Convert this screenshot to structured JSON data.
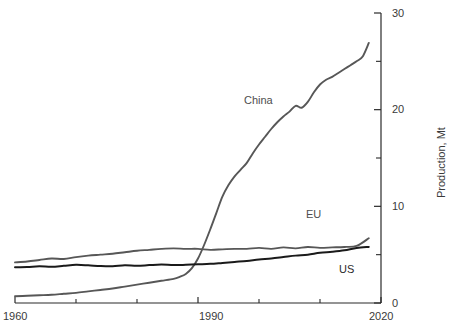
{
  "chart_data": {
    "type": "line",
    "title": "",
    "subtitle": "",
    "xlabel": "",
    "ylabel": "Production, Mt",
    "xlim": [
      1960,
      2020
    ],
    "ylim": [
      0,
      30
    ],
    "grid": false,
    "legend_position": "inline-labels",
    "x_major_ticks": [
      1960,
      1990,
      2020
    ],
    "x_minor_ticks": [
      1970,
      1980,
      2000,
      2010
    ],
    "x_tick_labels": [
      "1960",
      "1990",
      "2020"
    ],
    "y_major_ticks": [
      0,
      10,
      20,
      30
    ],
    "y_minor_ticks": [
      5,
      15,
      25
    ],
    "y_tick_labels": [
      "0",
      "10",
      "20",
      "30"
    ],
    "y_axis_side": "right",
    "series": [
      {
        "name": "China",
        "color": "#575757",
        "label_text": "China",
        "x": [
          1960,
          1962,
          1964,
          1966,
          1968,
          1970,
          1972,
          1974,
          1976,
          1978,
          1980,
          1982,
          1984,
          1986,
          1987,
          1988,
          1989,
          1990,
          1991,
          1992,
          1993,
          1994,
          1995,
          1996,
          1997,
          1998,
          1999,
          2000,
          2001,
          2002,
          2003,
          2004,
          2005,
          2006,
          2007,
          2008,
          2009,
          2010,
          2011,
          2012,
          2013,
          2014,
          2015,
          2016,
          2017,
          2018
        ],
        "values": [
          0.7,
          0.75,
          0.8,
          0.85,
          0.95,
          1.05,
          1.2,
          1.35,
          1.5,
          1.7,
          1.9,
          2.1,
          2.3,
          2.5,
          2.7,
          3.0,
          3.6,
          4.6,
          6.0,
          7.6,
          9.3,
          11.0,
          12.2,
          13.1,
          13.8,
          14.5,
          15.5,
          16.4,
          17.2,
          18.0,
          18.7,
          19.3,
          19.8,
          20.4,
          20.2,
          20.8,
          21.8,
          22.6,
          23.1,
          23.4,
          23.8,
          24.2,
          24.6,
          25.0,
          25.5,
          26.9
        ]
      },
      {
        "name": "EU",
        "color": "#575757",
        "label_text": "EU",
        "x": [
          1960,
          1962,
          1964,
          1966,
          1968,
          1970,
          1972,
          1974,
          1976,
          1978,
          1980,
          1982,
          1984,
          1986,
          1988,
          1990,
          1992,
          1994,
          1996,
          1998,
          2000,
          2002,
          2004,
          2006,
          2008,
          2010,
          2012,
          2014,
          2016,
          2018
        ],
        "values": [
          4.2,
          4.3,
          4.45,
          4.6,
          4.55,
          4.75,
          4.9,
          5.0,
          5.1,
          5.25,
          5.4,
          5.5,
          5.6,
          5.65,
          5.6,
          5.6,
          5.5,
          5.55,
          5.6,
          5.6,
          5.7,
          5.6,
          5.75,
          5.65,
          5.8,
          5.7,
          5.75,
          5.8,
          5.9,
          6.7
        ]
      },
      {
        "name": "US",
        "color": "#1a1a1a",
        "label_text": "US",
        "x": [
          1960,
          1962,
          1964,
          1966,
          1968,
          1970,
          1972,
          1974,
          1976,
          1978,
          1980,
          1982,
          1984,
          1986,
          1988,
          1990,
          1992,
          1994,
          1996,
          1998,
          2000,
          2002,
          2004,
          2006,
          2008,
          2010,
          2012,
          2014,
          2016,
          2018
        ],
        "values": [
          3.7,
          3.72,
          3.8,
          3.75,
          3.85,
          3.95,
          3.9,
          3.82,
          3.8,
          3.9,
          3.85,
          3.92,
          3.98,
          3.92,
          3.95,
          4.0,
          4.05,
          4.15,
          4.25,
          4.35,
          4.5,
          4.6,
          4.75,
          4.9,
          5.0,
          5.2,
          5.3,
          5.45,
          5.7,
          5.8
        ]
      }
    ]
  },
  "axes": {
    "y_title": "Production, Mt"
  },
  "colors": {
    "background": "#ffffff",
    "axis": "#2b2b2b",
    "text": "#3a3a3a",
    "china": "#575757",
    "eu": "#575757",
    "us": "#1a1a1a"
  }
}
